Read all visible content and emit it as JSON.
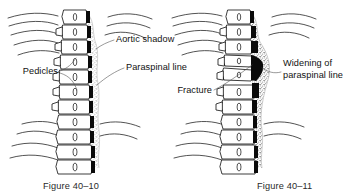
{
  "page": {
    "background_color": "#ffffff",
    "ink_color": "#111111",
    "leader_color": "#555555",
    "shadow_color": "#b9b9b9",
    "paraspinal_line_color": "#0a0a0a"
  },
  "figures": [
    {
      "id": "figure-40-10",
      "caption": "Figure 40–10",
      "labels": [
        {
          "name": "pedicles",
          "text": "Pedicles",
          "align": "end",
          "x": 58,
          "y": 74
        },
        {
          "name": "aortic-shadow",
          "text": "Aortic shadow",
          "align": "start",
          "x": 116,
          "y": 42
        },
        {
          "name": "paraspinal-line",
          "text": "Paraspinal line",
          "align": "start",
          "x": 126,
          "y": 70
        }
      ]
    },
    {
      "id": "figure-40-11",
      "caption": "Figure 40–11",
      "labels": [
        {
          "name": "fracture",
          "text": "Fracture",
          "align": "end",
          "x": 212,
          "y": 93
        },
        {
          "name": "widening-of-paraspinal-line",
          "text": "Widening of",
          "text_line_2": "paraspinal line",
          "align": "start",
          "x": 283,
          "y": 66
        }
      ]
    }
  ],
  "anatomy": {
    "vertebra_count": 12,
    "structures": [
      "vertebral body",
      "pedicle",
      "spinous process",
      "rib",
      "paraspinal line",
      "aortic shadow"
    ]
  }
}
